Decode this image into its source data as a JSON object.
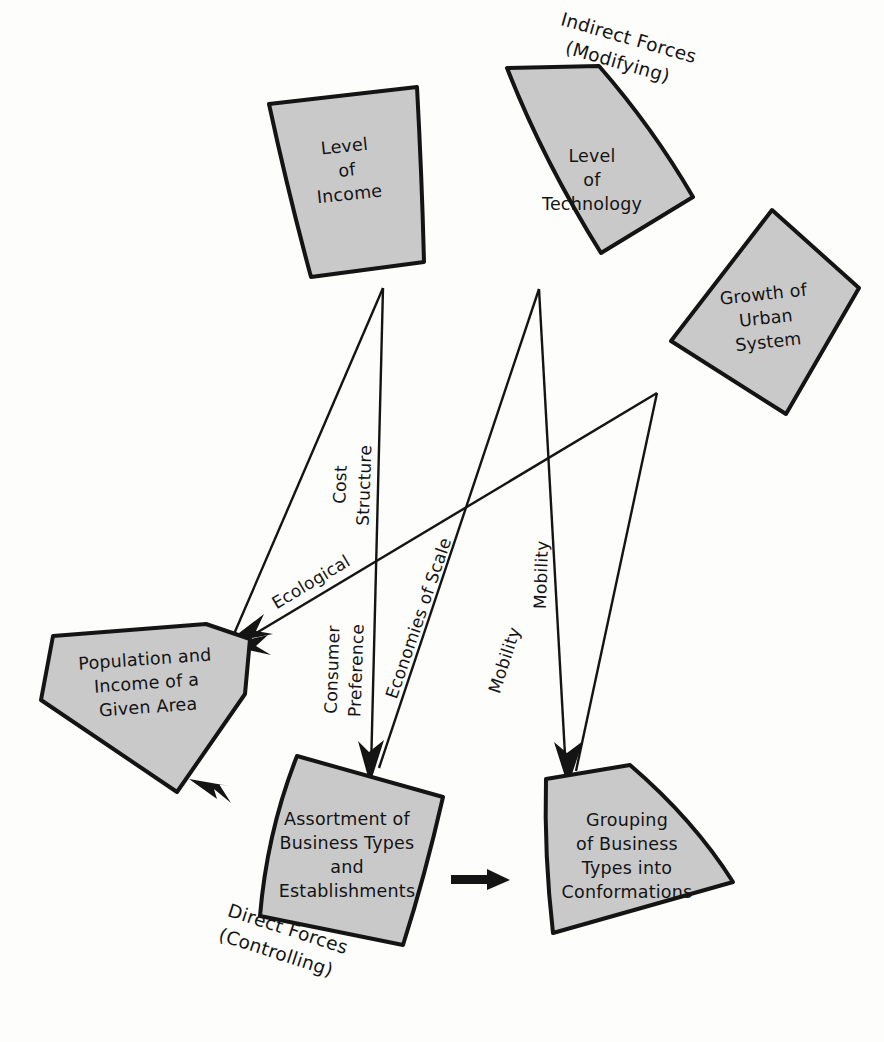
{
  "figure": {
    "background_color": "#fdfdfc",
    "shape_fill_color": "#c9c9c9",
    "shape_stroke_color": "#141414"
  },
  "group_labels": {
    "indirect": {
      "line1": "Indirect Forces",
      "line2": "(Modifying)"
    },
    "direct": {
      "line1": "Direct Forces",
      "line2": "(Controlling)"
    }
  },
  "nodes": [
    {
      "id": "level-of-income",
      "lines": [
        "Level",
        "of",
        "Income"
      ]
    },
    {
      "id": "level-of-technology",
      "lines": [
        "Level",
        "of",
        "Technology"
      ]
    },
    {
      "id": "growth-of-urban-system",
      "lines": [
        "Growth of",
        "Urban",
        "System"
      ]
    },
    {
      "id": "population-and-income",
      "lines": [
        "Population and",
        "Income of a",
        "Given Area"
      ]
    },
    {
      "id": "assortment-of-business-types",
      "lines": [
        "Assortment of",
        "Business Types",
        "and",
        "Establishments"
      ]
    },
    {
      "id": "grouping-of-business-types",
      "lines": [
        "Grouping",
        "of Business",
        "Types into",
        "Conformations"
      ]
    }
  ],
  "edge_labels": [
    {
      "id": "cost-structure",
      "lines": [
        "Cost",
        "Structure"
      ]
    },
    {
      "id": "ecological",
      "lines": [
        "Ecological"
      ]
    },
    {
      "id": "consumer-preference",
      "lines": [
        "Consumer",
        "Preference"
      ]
    },
    {
      "id": "economies-of-scale",
      "lines": [
        "Economies of Scale"
      ]
    },
    {
      "id": "mobility-upper",
      "lines": [
        "Mobility"
      ]
    },
    {
      "id": "mobility-lower",
      "lines": [
        "Mobility"
      ]
    }
  ]
}
